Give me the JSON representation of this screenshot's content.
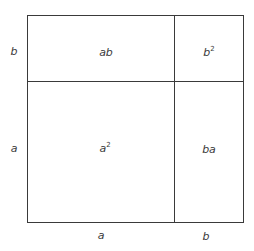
{
  "diagram": {
    "title": "",
    "side_labels": {
      "left_top": "b",
      "left_bottom": "a",
      "bottom_left": "a",
      "bottom_right": "b"
    },
    "cells": {
      "top_left": {
        "base": "ab",
        "sup": ""
      },
      "top_right": {
        "base": "b",
        "sup": "2"
      },
      "bottom_left": {
        "base": "a",
        "sup": "2"
      },
      "bottom_right": {
        "base": "ba",
        "sup": ""
      }
    },
    "colors": {
      "line": "#3a3a3a",
      "background": "#ffffff"
    }
  }
}
